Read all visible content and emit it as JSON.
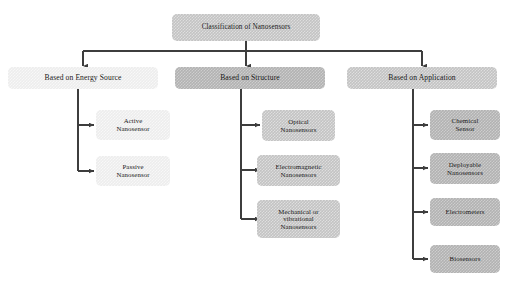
{
  "diagram": {
    "title_node": {
      "id": "root",
      "label": "Classification of Nanosensors",
      "x": 172,
      "y": 14,
      "w": 148,
      "h": 27,
      "font_size": 7.2,
      "tone": "tone-mid"
    },
    "level2": [
      {
        "id": "energy-source",
        "label": "Based on Energy Source",
        "x": 8,
        "y": 67,
        "w": 150,
        "h": 22,
        "font_size": 7.6,
        "tone": "tone-light"
      },
      {
        "id": "structure",
        "label": "Based on Structure",
        "x": 175,
        "y": 67,
        "w": 150,
        "h": 22,
        "font_size": 7.6,
        "tone": "tone-dark"
      },
      {
        "id": "application",
        "label": "Based on Application",
        "x": 347,
        "y": 67,
        "w": 150,
        "h": 22,
        "font_size": 7.6,
        "tone": "tone-mid"
      }
    ],
    "level3": [
      {
        "id": "active-nanosensor",
        "label": "Active\nNanosensor",
        "parent": "energy-source",
        "x": 96,
        "y": 110,
        "w": 74,
        "h": 30,
        "font_size": 6.8,
        "tone": "tone-light"
      },
      {
        "id": "passive-nanosensor",
        "label": "Passive\nNanosensor",
        "parent": "energy-source",
        "x": 96,
        "y": 156,
        "w": 74,
        "h": 30,
        "font_size": 6.8,
        "tone": "tone-light"
      },
      {
        "id": "optical-nanosensors",
        "label": "Optical\nNanosensors",
        "parent": "structure",
        "x": 262,
        "y": 110,
        "w": 73,
        "h": 31,
        "font_size": 6.8,
        "tone": "tone-mid"
      },
      {
        "id": "electromagnetic-nanosensors",
        "label": "Electromagnetic\nNanosensors",
        "parent": "structure",
        "x": 257,
        "y": 155,
        "w": 83,
        "h": 31,
        "font_size": 6.8,
        "tone": "tone-mid"
      },
      {
        "id": "mechanical-vibrational-nanosensors",
        "label": "Mechanical or\nvibrational\nNanosensors",
        "parent": "structure",
        "x": 257,
        "y": 200,
        "w": 83,
        "h": 38,
        "font_size": 6.8,
        "tone": "tone-mid"
      },
      {
        "id": "chemical-sensor",
        "label": "Chemical\nSensor",
        "parent": "application",
        "x": 430,
        "y": 110,
        "w": 70,
        "h": 30,
        "font_size": 6.8,
        "tone": "tone-dark"
      },
      {
        "id": "deployable-nanosensors",
        "label": "Deployable\nNanosensors",
        "parent": "application",
        "x": 430,
        "y": 153,
        "w": 70,
        "h": 31,
        "font_size": 6.8,
        "tone": "tone-dark"
      },
      {
        "id": "electrometers",
        "label": "Electrometers",
        "parent": "application",
        "x": 430,
        "y": 198,
        "w": 70,
        "h": 28,
        "font_size": 6.8,
        "tone": "tone-dark"
      },
      {
        "id": "biosensors",
        "label": "Biosensors",
        "parent": "application",
        "x": 430,
        "y": 245,
        "w": 70,
        "h": 28,
        "font_size": 6.8,
        "tone": "tone-dark"
      }
    ],
    "edges": {
      "stroke": "#3d3d3d",
      "stroke_width": 1.15,
      "root_stem": {
        "x": 246,
        "y_from": 41,
        "y_to": 51
      },
      "distribution_bar": {
        "y": 51,
        "x_from": 83,
        "x_to": 422
      },
      "level2_drops": [
        {
          "x": 83,
          "y_from": 51,
          "y_to": 66
        },
        {
          "x": 246,
          "y_from": 51,
          "y_to": 66
        },
        {
          "x": 422,
          "y_from": 51,
          "y_to": 66
        }
      ],
      "branch_stems": [
        {
          "x": 78,
          "y_from": 89,
          "y_to": 171
        },
        {
          "x": 241,
          "y_from": 89,
          "y_to": 219
        },
        {
          "x": 413,
          "y_from": 89,
          "y_to": 259
        }
      ],
      "branch_arms": [
        {
          "x_from": 78,
          "x_to": 94,
          "y": 125
        },
        {
          "x_from": 78,
          "x_to": 94,
          "y": 171
        },
        {
          "x_from": 241,
          "x_to": 260,
          "y": 125
        },
        {
          "x_from": 241,
          "x_to": 260,
          "y": 170
        },
        {
          "x_from": 241,
          "x_to": 260,
          "y": 219
        },
        {
          "x_from": 413,
          "x_to": 428,
          "y": 125
        },
        {
          "x_from": 413,
          "x_to": 428,
          "y": 168
        },
        {
          "x_from": 413,
          "x_to": 428,
          "y": 212
        },
        {
          "x_from": 413,
          "x_to": 428,
          "y": 259
        }
      ]
    }
  }
}
